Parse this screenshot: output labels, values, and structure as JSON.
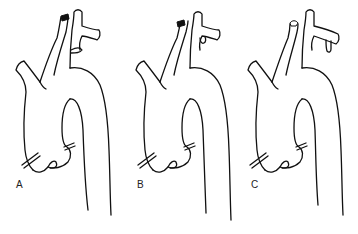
{
  "figure": {
    "panels": [
      {
        "id": "A",
        "label": "A",
        "variant": "branch-below-arch-vessel"
      },
      {
        "id": "B",
        "label": "B",
        "variant": "small-branch-from-subclavian"
      },
      {
        "id": "C",
        "label": "C",
        "variant": "distal-branch-from-subclavian"
      }
    ]
  },
  "colors": {
    "background": "#ffffff",
    "stroke": "#111111"
  }
}
